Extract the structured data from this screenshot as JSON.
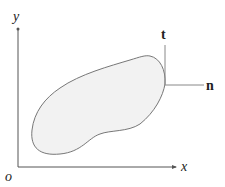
{
  "diagram": {
    "axes": {
      "x_label": "x",
      "y_label": "y",
      "origin_label": "o"
    },
    "vectors": {
      "tangent_label": "t",
      "normal_label": "n"
    },
    "colors": {
      "region_fill": "#f2f2f2",
      "region_stroke": "#777777",
      "axis": "#555555"
    }
  }
}
